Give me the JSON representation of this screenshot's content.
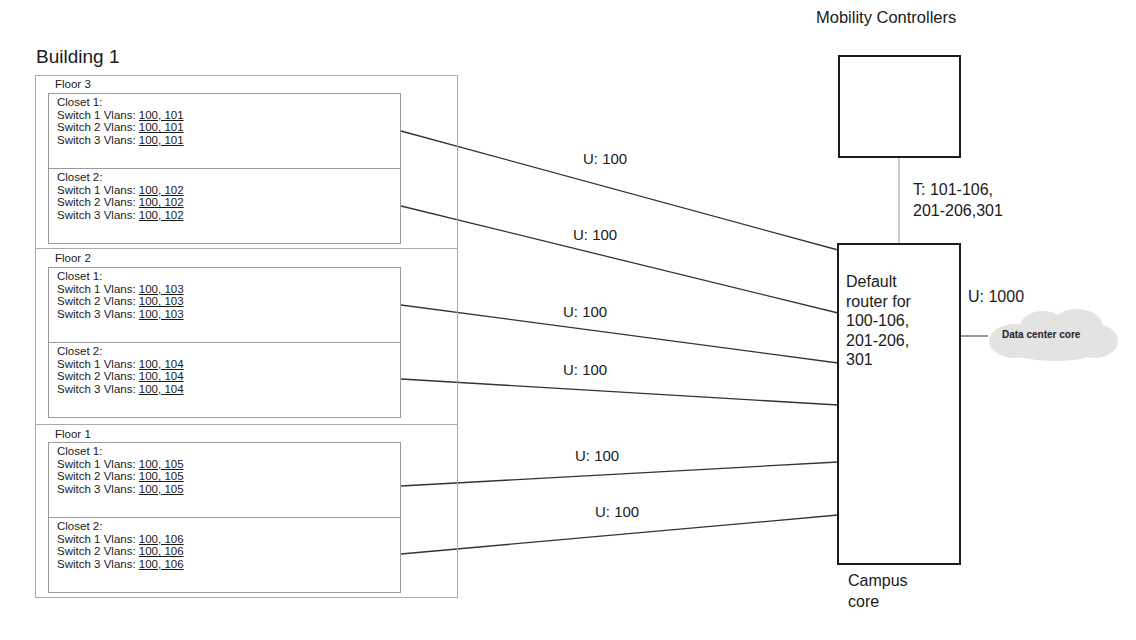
{
  "building": {
    "title": "Building 1",
    "floors": [
      {
        "label": "Floor 3",
        "closets": [
          {
            "label": "Closet 1:",
            "switches": [
              {
                "label": "Switch 1 Vlans: ",
                "vlans": "100, 101"
              },
              {
                "label": "Switch 2 Vlans: ",
                "vlans": "100, 101"
              },
              {
                "label": "Switch 3 Vlans: ",
                "vlans": "100, 101"
              }
            ]
          },
          {
            "label": "Closet 2:",
            "switches": [
              {
                "label": "Switch 1 Vlans: ",
                "vlans": "100, 102"
              },
              {
                "label": "Switch 2 Vlans: ",
                "vlans": "100, 102"
              },
              {
                "label": "Switch 3 Vlans: ",
                "vlans": "100, 102"
              }
            ]
          }
        ]
      },
      {
        "label": "Floor 2",
        "closets": [
          {
            "label": "Closet 1:",
            "switches": [
              {
                "label": "Switch 1 Vlans: ",
                "vlans": "100, 103"
              },
              {
                "label": "Switch 2 Vlans: ",
                "vlans": "100, 103"
              },
              {
                "label": "Switch 3 Vlans: ",
                "vlans": "100, 103"
              }
            ]
          },
          {
            "label": "Closet 2:",
            "switches": [
              {
                "label": "Switch 1 Vlans: ",
                "vlans": "100, 104"
              },
              {
                "label": "Switch 2 Vlans: ",
                "vlans": "100, 104"
              },
              {
                "label": "Switch 3 Vlans: ",
                "vlans": "100, 104"
              }
            ]
          }
        ]
      },
      {
        "label": "Floor 1",
        "closets": [
          {
            "label": "Closet 1:",
            "switches": [
              {
                "label": "Switch 1 Vlans: ",
                "vlans": "100, 105"
              },
              {
                "label": "Switch 2 Vlans: ",
                "vlans": "100, 105"
              },
              {
                "label": "Switch 3 Vlans: ",
                "vlans": "100, 105"
              }
            ]
          },
          {
            "label": "Closet 2:",
            "switches": [
              {
                "label": "Switch 1 Vlans: ",
                "vlans": "100, 106"
              },
              {
                "label": "Switch 2 Vlans: ",
                "vlans": "100, 106"
              },
              {
                "label": "Switch 3 Vlans: ",
                "vlans": "100, 106"
              }
            ]
          }
        ]
      }
    ]
  },
  "links": [
    {
      "label": "U: 100"
    },
    {
      "label": "U: 100"
    },
    {
      "label": "U: 100"
    },
    {
      "label": "U: 100"
    },
    {
      "label": "U: 100"
    },
    {
      "label": "U: 100"
    }
  ],
  "mobility_controllers": {
    "title": "Mobility Controllers",
    "trunk_label_line1": "T: 101-106,",
    "trunk_label_line2": "201-206,301"
  },
  "campus_core": {
    "router_text": [
      "Default",
      "router for",
      "100-106,",
      "201-206,",
      "301"
    ],
    "label_line1": "Campus",
    "label_line2": "core",
    "uplink_label": "U: 1000"
  },
  "data_center": {
    "label": "Data center core"
  }
}
